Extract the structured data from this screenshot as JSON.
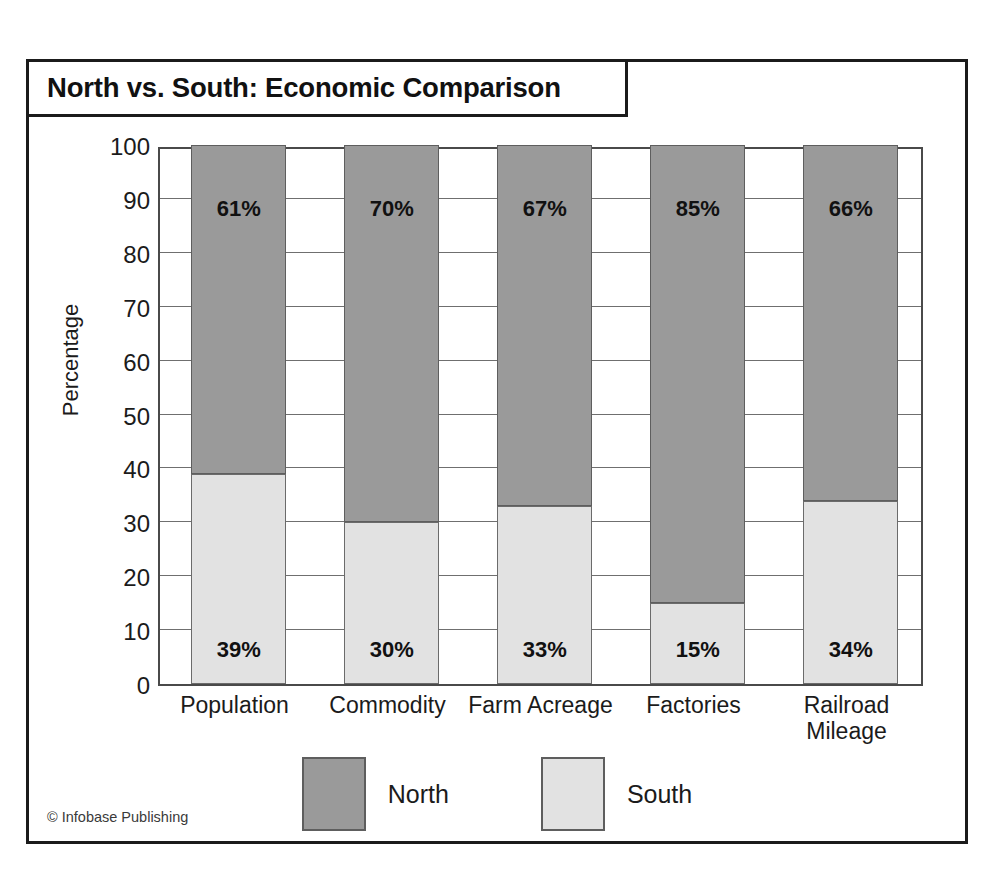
{
  "figure": {
    "title": "North vs. South: Economic Comparison",
    "credit": "© Infobase Publishing"
  },
  "chart_data": {
    "type": "bar",
    "subtype": "stacked-percent",
    "title": "North vs. South: Economic Comparison",
    "xlabel": "",
    "ylabel": "Percentage",
    "ylim": [
      0,
      100
    ],
    "ytick_step": 10,
    "grid": true,
    "legend_position": "bottom-center",
    "categories": [
      "Population",
      "Commodity",
      "Farm Acreage",
      "Factories",
      "Railroad Mileage"
    ],
    "series": [
      {
        "name": "North",
        "color": "#9a9a9a",
        "values": [
          61,
          70,
          67,
          85,
          66
        ],
        "labels": [
          "61%",
          "70%",
          "67%",
          "85%",
          "66%"
        ]
      },
      {
        "name": "South",
        "color": "#e2e2e2",
        "values": [
          39,
          30,
          33,
          15,
          34
        ],
        "labels": [
          "39%",
          "30%",
          "33%",
          "15%",
          "34%"
        ]
      }
    ],
    "yticks": [
      {
        "value": 100,
        "label": "100"
      },
      {
        "value": 90,
        "label": "90"
      },
      {
        "value": 80,
        "label": "80"
      },
      {
        "value": 70,
        "label": "70"
      },
      {
        "value": 60,
        "label": "60"
      },
      {
        "value": 50,
        "label": "50"
      },
      {
        "value": 40,
        "label": "40"
      },
      {
        "value": 30,
        "label": "30"
      },
      {
        "value": 20,
        "label": "20"
      },
      {
        "value": 10,
        "label": "10"
      },
      {
        "value": 0,
        "label": "0"
      }
    ],
    "category_labels": [
      {
        "line1": "Population",
        "line2": ""
      },
      {
        "line1": "Commodity",
        "line2": ""
      },
      {
        "line1": "Farm Acreage",
        "line2": ""
      },
      {
        "line1": "Factories",
        "line2": ""
      },
      {
        "line1": "Railroad",
        "line2": "Mileage"
      }
    ],
    "legend": [
      {
        "label": "North",
        "color": "#9a9a9a"
      },
      {
        "label": "South",
        "color": "#e2e2e2"
      }
    ]
  }
}
